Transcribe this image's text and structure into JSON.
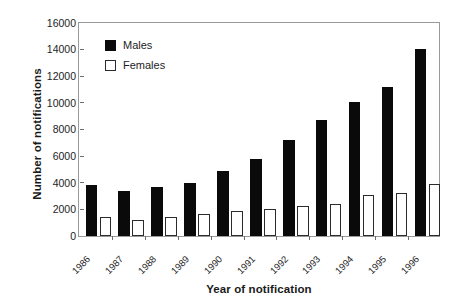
{
  "chart_data": {
    "type": "bar",
    "title": "",
    "subtitle": "",
    "xlabel": "Year of notification",
    "ylabel": "Number of notifications",
    "categories": [
      "1986",
      "1987",
      "1988",
      "1989",
      "1990",
      "1991",
      "1992",
      "1993",
      "1994",
      "1995",
      "1996"
    ],
    "series": [
      {
        "name": "Males",
        "color": "#0a0a0a",
        "fill": "solid-black",
        "values": [
          3800,
          3350,
          3700,
          3950,
          4900,
          5800,
          7200,
          8750,
          10100,
          11200,
          14050
        ]
      },
      {
        "name": "Females",
        "color": "#ffffff",
        "fill": "white-outline",
        "values": [
          1450,
          1200,
          1450,
          1650,
          1850,
          2050,
          2250,
          2400,
          3050,
          3200,
          3900
        ]
      }
    ],
    "ylim": [
      0,
      16000
    ],
    "ytick_values": [
      0,
      2000,
      4000,
      6000,
      8000,
      10000,
      12000,
      14000,
      16000
    ],
    "ytick_labels": [
      "0",
      "2000",
      "4000",
      "6000",
      "8000",
      "10000",
      "12000",
      "14000",
      "16000"
    ],
    "grid": false,
    "legend_position": "inside-upper-left",
    "xtick_rotation": -45
  }
}
